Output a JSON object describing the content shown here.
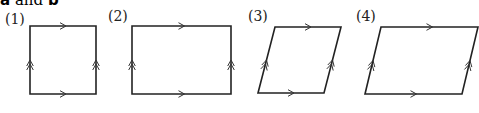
{
  "caption": {
    "v1": "a",
    "and": " and ",
    "v2": "b"
  },
  "figures": [
    {
      "label": "(1)",
      "shape": "square",
      "points": [
        [
          30,
          26
        ],
        [
          96,
          26
        ],
        [
          96,
          94
        ],
        [
          30,
          94
        ]
      ]
    },
    {
      "label": "(2)",
      "shape": "rectangle",
      "points": [
        [
          132,
          26
        ],
        [
          231,
          26
        ],
        [
          231,
          94
        ],
        [
          132,
          94
        ]
      ]
    },
    {
      "label": "(3)",
      "shape": "rhombus",
      "points": [
        [
          275,
          27
        ],
        [
          341,
          27
        ],
        [
          324,
          93
        ],
        [
          258,
          93
        ]
      ]
    },
    {
      "label": "(4)",
      "shape": "parallelogram",
      "points": [
        [
          381,
          27
        ],
        [
          478,
          27
        ],
        [
          462,
          94
        ],
        [
          365,
          94
        ]
      ]
    }
  ],
  "marks": {
    "horizontal": "single-arrow a",
    "vertical": "double-arrow b"
  }
}
